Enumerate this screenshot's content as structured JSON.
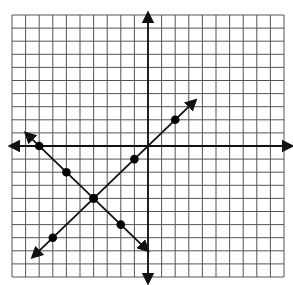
{
  "chart_data": {
    "type": "line",
    "title": "",
    "xlabel": "",
    "ylabel": "",
    "xlim": [
      -10,
      10
    ],
    "ylim": [
      -10,
      10
    ],
    "grid": true,
    "grid_step": 1,
    "legend": null,
    "axes": {
      "x_arrows": true,
      "y_arrows": true
    },
    "series": [
      {
        "name": "line-negative-slope",
        "slope": -1,
        "intercept": -8,
        "points": [
          [
            -8,
            0
          ],
          [
            -6,
            -2
          ],
          [
            -4,
            -4
          ],
          [
            -2,
            -6
          ]
        ],
        "arrow_ends": [
          [
            -9,
            1
          ],
          [
            0,
            -8
          ]
        ]
      },
      {
        "name": "line-positive-slope",
        "slope": 1,
        "intercept": 0,
        "points": [
          [
            -7,
            -7
          ],
          [
            -4,
            -4
          ],
          [
            -1,
            -1
          ],
          [
            2,
            2
          ]
        ],
        "arrow_ends": [
          [
            -8.5,
            -8.5
          ],
          [
            3.5,
            3.5
          ]
        ]
      }
    ],
    "intersection": [
      -4,
      -4
    ]
  },
  "colors": {
    "grid": "#555555",
    "axis": "#111111",
    "line": "#111111",
    "point": "#000000",
    "background": "#ffffff"
  }
}
